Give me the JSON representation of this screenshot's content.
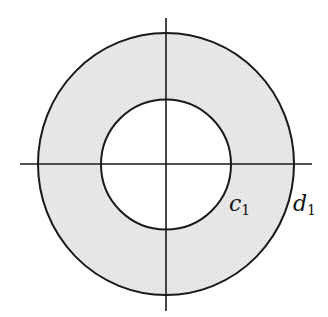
{
  "diagram": {
    "type": "annulus",
    "center": {
      "x": 166,
      "y": 164
    },
    "inner_circle": {
      "radius": 65,
      "label": "c",
      "subscript": "1"
    },
    "outer_circle": {
      "radius": 129,
      "label": "d",
      "subscript": "1"
    },
    "fill_color": "#e6e6e6",
    "stroke_color": "#1a1a1a",
    "axes": {
      "horizontal": {
        "x1": 20,
        "x2": 312,
        "y": 164
      },
      "vertical": {
        "x": 166,
        "y1": 18,
        "y2": 311
      }
    }
  }
}
